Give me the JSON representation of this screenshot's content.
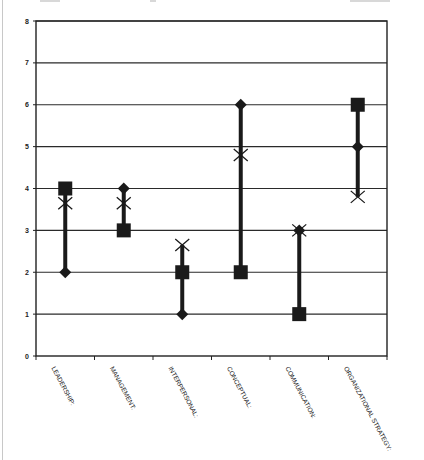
{
  "chart_data": {
    "type": "scatter",
    "subtype": "high-low range chart",
    "title": "",
    "xlabel": "",
    "ylabel": "",
    "ylim": [
      0,
      8
    ],
    "yticks": [
      0,
      1,
      2,
      3,
      4,
      5,
      6,
      7,
      8
    ],
    "grid": true,
    "legend": null,
    "categories": [
      "LEADERSHIP:",
      "MANAGEMENT:",
      "INTERPERSONAL:",
      "CONCEPTUAL:",
      "COMMUNICATION:",
      "ORGANIZATIONAL STRATEGY:"
    ],
    "series": [
      {
        "name": "Diamond",
        "marker": "diamond",
        "values": [
          2,
          4,
          1,
          6,
          3,
          5
        ]
      },
      {
        "name": "Square",
        "marker": "square",
        "values": [
          4,
          3,
          2,
          2,
          1,
          6
        ]
      },
      {
        "name": "X",
        "marker": "x",
        "values": [
          3.65,
          3.65,
          2.65,
          4.8,
          3,
          3.8
        ]
      }
    ],
    "colors": {
      "marker": "#1a1a1a",
      "grid": "#2a2a2a",
      "background": "#ffffff"
    }
  }
}
